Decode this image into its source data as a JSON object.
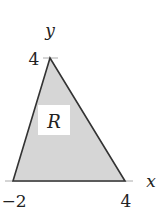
{
  "diagram": {
    "type": "region-plot",
    "region_label": "R",
    "axes": {
      "x_label": "x",
      "y_label": "y"
    },
    "vertices": [
      {
        "x": -2,
        "y": 0
      },
      {
        "x": 0,
        "y": 4
      },
      {
        "x": 4,
        "y": 0
      }
    ],
    "tick_labels": {
      "x": [
        "−2",
        "4"
      ],
      "y": [
        "4"
      ]
    },
    "colors": {
      "fill": "#d6d6d6",
      "stroke": "#333333",
      "axis": "#999999",
      "label_bg": "#ffffff"
    }
  }
}
